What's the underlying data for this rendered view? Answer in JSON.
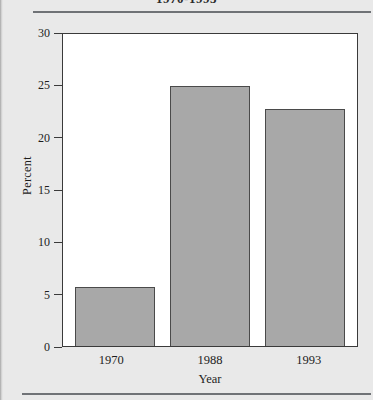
{
  "page": {
    "running_title": "1970-1993",
    "background_color": "#e9e9e9",
    "rule_color": "#6f7276"
  },
  "chart_data": {
    "type": "bar",
    "title": "1970-1993",
    "categories": [
      "1970",
      "1988",
      "1993"
    ],
    "values": [
      5.6,
      24.8,
      22.6
    ],
    "xlabel": "Year",
    "ylabel": "Percent",
    "ylim": [
      0,
      30
    ],
    "yticks": [
      0,
      5,
      10,
      15,
      20,
      25,
      30
    ],
    "ytick_labels": [
      "0",
      "5",
      "10",
      "15",
      "20",
      "25",
      "30"
    ],
    "grid": false,
    "legend": false,
    "bar_color": "#a8a8a8",
    "bar_edge_color": "#4a4a4a",
    "plot_background": "#ffffff",
    "frame_color": "#3a3a3a"
  }
}
